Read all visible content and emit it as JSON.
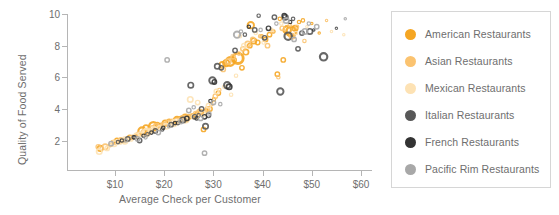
{
  "chart_data": {
    "type": "scatter",
    "title": "",
    "xlabel": "Average Check per Customer",
    "ylabel": "Quality of Food Served",
    "xlim": [
      0,
      62
    ],
    "ylim": [
      0,
      10.6
    ],
    "xticks": [
      "$10",
      "$20",
      "$30",
      "$40",
      "$50",
      "$60"
    ],
    "xtick_values": [
      10,
      20,
      30,
      40,
      50,
      60
    ],
    "yticks": [
      "2",
      "4",
      "6",
      "8",
      "10"
    ],
    "ytick_values": [
      2,
      4,
      6,
      8,
      10
    ],
    "grid": false,
    "legend_position": "right",
    "marker_style": "open-circle-bubble",
    "series": [
      {
        "name": "American Restaurants",
        "color": "#F5A623",
        "points": [
          [
            7.0,
            1.5,
            7
          ],
          [
            9.6,
            1.9,
            5
          ],
          [
            10.4,
            2.0,
            6
          ],
          [
            11.8,
            2.0,
            5
          ],
          [
            13.0,
            2.2,
            6
          ],
          [
            14.2,
            2.3,
            5
          ],
          [
            15.5,
            2.6,
            9
          ],
          [
            16.3,
            2.8,
            7
          ],
          [
            17.0,
            2.6,
            6
          ],
          [
            17.8,
            2.9,
            10
          ],
          [
            18.6,
            3.0,
            6
          ],
          [
            19.4,
            3.0,
            5
          ],
          [
            20.2,
            3.1,
            7
          ],
          [
            21.0,
            3.2,
            6
          ],
          [
            21.8,
            3.2,
            5
          ],
          [
            22.6,
            3.3,
            8
          ],
          [
            23.5,
            3.4,
            6
          ],
          [
            24.3,
            3.4,
            9
          ],
          [
            25.1,
            3.5,
            6
          ],
          [
            25.9,
            3.6,
            5
          ],
          [
            26.7,
            3.6,
            7
          ],
          [
            27.5,
            3.8,
            6
          ],
          [
            28.0,
            2.7,
            6
          ],
          [
            28.5,
            3.9,
            5
          ],
          [
            29.3,
            4.0,
            6
          ],
          [
            30.1,
            4.6,
            5
          ],
          [
            31.0,
            5.0,
            6
          ],
          [
            31.8,
            6.8,
            7
          ],
          [
            32.6,
            6.9,
            8
          ],
          [
            33.4,
            7.0,
            10
          ],
          [
            34.2,
            7.1,
            6
          ],
          [
            35.0,
            7.2,
            12
          ],
          [
            35.8,
            6.6,
            6
          ],
          [
            36.6,
            7.6,
            7
          ],
          [
            37.4,
            8.0,
            6
          ],
          [
            37.6,
            9.3,
            8
          ],
          [
            38.2,
            8.3,
            7
          ],
          [
            39.0,
            8.2,
            6
          ],
          [
            39.8,
            8.6,
            5
          ],
          [
            40.6,
            8.4,
            6
          ],
          [
            41.4,
            8.7,
            6
          ],
          [
            42.2,
            8.9,
            5
          ],
          [
            43.0,
            6.2,
            6
          ],
          [
            43.5,
            9.7,
            5
          ],
          [
            44.2,
            7.1,
            6
          ],
          [
            45.0,
            9.0,
            9
          ],
          [
            45.8,
            8.9,
            11
          ],
          [
            46.6,
            9.1,
            7
          ],
          [
            47.4,
            9.5,
            5
          ],
          [
            48.2,
            9.6,
            5
          ],
          [
            50.0,
            9.4,
            4
          ],
          [
            51.5,
            8.8,
            4
          ]
        ]
      },
      {
        "name": "Asian Restaurants",
        "color": "#FBC370",
        "points": [
          [
            6.6,
            1.6,
            6
          ],
          [
            8.0,
            1.6,
            7
          ],
          [
            9.0,
            1.7,
            5
          ],
          [
            10.0,
            1.9,
            6
          ],
          [
            11.2,
            2.0,
            7
          ],
          [
            12.4,
            2.1,
            5
          ],
          [
            13.6,
            2.2,
            6
          ],
          [
            14.8,
            2.4,
            6
          ],
          [
            16.0,
            2.5,
            8
          ],
          [
            16.8,
            2.7,
            5
          ],
          [
            17.6,
            2.8,
            6
          ],
          [
            18.4,
            2.9,
            7
          ],
          [
            19.2,
            2.9,
            5
          ],
          [
            20.0,
            3.0,
            6
          ],
          [
            20.8,
            3.1,
            7
          ],
          [
            21.6,
            3.2,
            6
          ],
          [
            22.4,
            3.3,
            5
          ],
          [
            23.2,
            3.3,
            6
          ],
          [
            24.0,
            3.4,
            7
          ],
          [
            24.8,
            3.5,
            6
          ],
          [
            25.6,
            3.6,
            5
          ],
          [
            26.4,
            3.7,
            6
          ],
          [
            27.2,
            3.8,
            7
          ],
          [
            28.8,
            4.0,
            6
          ],
          [
            29.6,
            4.3,
            5
          ],
          [
            30.4,
            4.8,
            6
          ],
          [
            31.2,
            5.2,
            5
          ],
          [
            32.0,
            6.5,
            6
          ],
          [
            33.0,
            7.0,
            7
          ],
          [
            34.0,
            7.3,
            6
          ],
          [
            35.2,
            7.5,
            5
          ],
          [
            36.0,
            7.8,
            6
          ],
          [
            37.0,
            8.1,
            7
          ],
          [
            38.0,
            8.4,
            6
          ],
          [
            39.5,
            8.6,
            5
          ],
          [
            41.0,
            8.0,
            6
          ],
          [
            42.0,
            8.9,
            5
          ],
          [
            43.2,
            6.0,
            5
          ],
          [
            44.0,
            9.1,
            6
          ],
          [
            45.5,
            9.3,
            5
          ],
          [
            46.0,
            8.6,
            7
          ],
          [
            47.0,
            9.2,
            5
          ],
          [
            48.5,
            8.3,
            5
          ],
          [
            53.0,
            9.6,
            4
          ]
        ]
      },
      {
        "name": "Mexican Restaurants",
        "color": "#FDE2B4",
        "points": [
          [
            6.8,
            1.3,
            7
          ],
          [
            8.4,
            1.5,
            6
          ],
          [
            9.8,
            1.8,
            7
          ],
          [
            11.0,
            1.9,
            6
          ],
          [
            12.0,
            2.0,
            8
          ],
          [
            13.2,
            2.1,
            6
          ],
          [
            14.4,
            2.3,
            7
          ],
          [
            15.2,
            2.4,
            6
          ],
          [
            16.4,
            2.5,
            9
          ],
          [
            17.2,
            2.6,
            6
          ],
          [
            18.0,
            2.7,
            7
          ],
          [
            19.0,
            2.8,
            6
          ],
          [
            20.4,
            2.9,
            7
          ],
          [
            21.2,
            3.0,
            6
          ],
          [
            22.0,
            3.1,
            8
          ],
          [
            23.0,
            3.2,
            6
          ],
          [
            24.4,
            3.3,
            7
          ],
          [
            25.3,
            4.6,
            7
          ],
          [
            26.0,
            3.5,
            6
          ],
          [
            26.8,
            4.4,
            6
          ],
          [
            27.8,
            3.7,
            7
          ],
          [
            29.0,
            4.2,
            6
          ],
          [
            30.6,
            5.1,
            6
          ],
          [
            32.2,
            5.4,
            5
          ],
          [
            33.6,
            4.9,
            5
          ],
          [
            34.6,
            6.1,
            5
          ],
          [
            35.4,
            8.6,
            5
          ],
          [
            36.2,
            8.0,
            6
          ],
          [
            38.6,
            8.8,
            5
          ],
          [
            40.2,
            8.2,
            5
          ],
          [
            41.8,
            9.0,
            5
          ],
          [
            43.8,
            9.4,
            5
          ],
          [
            46.8,
            8.8,
            5
          ],
          [
            49.0,
            9.2,
            4
          ],
          [
            54.0,
            8.9,
            4
          ],
          [
            56.5,
            8.7,
            4
          ]
        ]
      },
      {
        "name": "Italian Restaurants",
        "color": "#585858",
        "points": [
          [
            10.6,
            1.9,
            5
          ],
          [
            12.6,
            2.1,
            6
          ],
          [
            14.0,
            2.2,
            5
          ],
          [
            15.0,
            2.0,
            6
          ],
          [
            16.6,
            2.4,
            5
          ],
          [
            18.2,
            2.6,
            6
          ],
          [
            19.6,
            2.7,
            5
          ],
          [
            21.4,
            3.0,
            6
          ],
          [
            22.8,
            3.1,
            5
          ],
          [
            23.8,
            3.3,
            7
          ],
          [
            25.4,
            5.5,
            7
          ],
          [
            26.2,
            3.5,
            6
          ],
          [
            27.0,
            3.6,
            5
          ],
          [
            27.6,
            4.0,
            6
          ],
          [
            28.4,
            2.9,
            7
          ],
          [
            29.0,
            3.6,
            6
          ],
          [
            29.8,
            5.8,
            8
          ],
          [
            30.8,
            6.7,
            7
          ],
          [
            31.6,
            6.6,
            6
          ],
          [
            32.8,
            5.5,
            8
          ],
          [
            34.4,
            7.7,
            6
          ],
          [
            36.4,
            8.7,
            5
          ],
          [
            38.4,
            9.0,
            6
          ],
          [
            39.2,
            9.9,
            5
          ],
          [
            40.4,
            8.5,
            6
          ],
          [
            42.4,
            9.8,
            6
          ],
          [
            43.6,
            5.1,
            8
          ],
          [
            44.6,
            9.8,
            7
          ],
          [
            45.2,
            8.6,
            9
          ],
          [
            46.2,
            9.7,
            5
          ],
          [
            47.2,
            7.8,
            6
          ],
          [
            48.0,
            8.8,
            6
          ],
          [
            49.6,
            8.9,
            7
          ],
          [
            52.4,
            7.3,
            9
          ],
          [
            55.0,
            9.1,
            4
          ]
        ]
      },
      {
        "name": "French Restaurants",
        "color": "#333333",
        "points": [
          [
            11.4,
            2.0,
            5
          ],
          [
            13.8,
            2.2,
            5
          ],
          [
            15.8,
            2.3,
            5
          ],
          [
            17.4,
            2.5,
            5
          ],
          [
            19.8,
            2.8,
            5
          ],
          [
            22.2,
            3.1,
            5
          ],
          [
            24.6,
            3.4,
            6
          ],
          [
            26.6,
            3.4,
            5
          ],
          [
            28.2,
            3.5,
            6
          ],
          [
            29.4,
            4.5,
            5
          ],
          [
            30.2,
            5.7,
            6
          ],
          [
            33.2,
            5.4,
            7
          ],
          [
            37.2,
            9.2,
            5
          ],
          [
            41.2,
            9.1,
            6
          ],
          [
            44.4,
            9.9,
            6
          ],
          [
            45.6,
            9.5,
            5
          ],
          [
            50.4,
            9.0,
            4
          ]
        ]
      },
      {
        "name": "Pacific Rim Restaurants",
        "color": "#A8A8A8",
        "points": [
          [
            9.2,
            1.8,
            6
          ],
          [
            12.2,
            2.0,
            5
          ],
          [
            14.6,
            2.1,
            6
          ],
          [
            16.2,
            2.2,
            5
          ],
          [
            18.8,
            2.5,
            6
          ],
          [
            20.6,
            7.1,
            6
          ],
          [
            21.0,
            2.9,
            5
          ],
          [
            23.4,
            3.2,
            6
          ],
          [
            25.0,
            3.9,
            6
          ],
          [
            26.0,
            4.1,
            5
          ],
          [
            27.4,
            3.4,
            6
          ],
          [
            28.2,
            1.2,
            6
          ],
          [
            29.2,
            3.7,
            5
          ],
          [
            30.0,
            4.4,
            6
          ],
          [
            31.4,
            4.3,
            5
          ],
          [
            34.8,
            8.7,
            8
          ],
          [
            35.6,
            8.9,
            5
          ],
          [
            39.6,
            9.0,
            5
          ],
          [
            42.8,
            9.4,
            5
          ],
          [
            44.8,
            9.6,
            7
          ],
          [
            46.4,
            8.4,
            6
          ],
          [
            48.6,
            8.9,
            7
          ],
          [
            49.4,
            9.4,
            5
          ],
          [
            51.0,
            9.2,
            6
          ],
          [
            56.8,
            9.7,
            4
          ]
        ]
      }
    ]
  },
  "legend": {
    "items": [
      {
        "label": "American Restaurants",
        "color": "#F5A623"
      },
      {
        "label": "Asian Restaurants",
        "color": "#FBC370"
      },
      {
        "label": "Mexican Restaurants",
        "color": "#FDE2B4"
      },
      {
        "label": "Italian Restaurants",
        "color": "#585858"
      },
      {
        "label": "French Restaurants",
        "color": "#333333"
      },
      {
        "label": "Pacific Rim Restaurants",
        "color": "#A8A8A8"
      }
    ]
  },
  "axes": {
    "x_title": "Average Check per Customer",
    "y_title": "Quality of Food Served"
  },
  "colors": {
    "axis_line": "#b5b5b5",
    "text": "#6e6e6e",
    "legend_border": "#d6d6d6",
    "background": "#ffffff"
  }
}
